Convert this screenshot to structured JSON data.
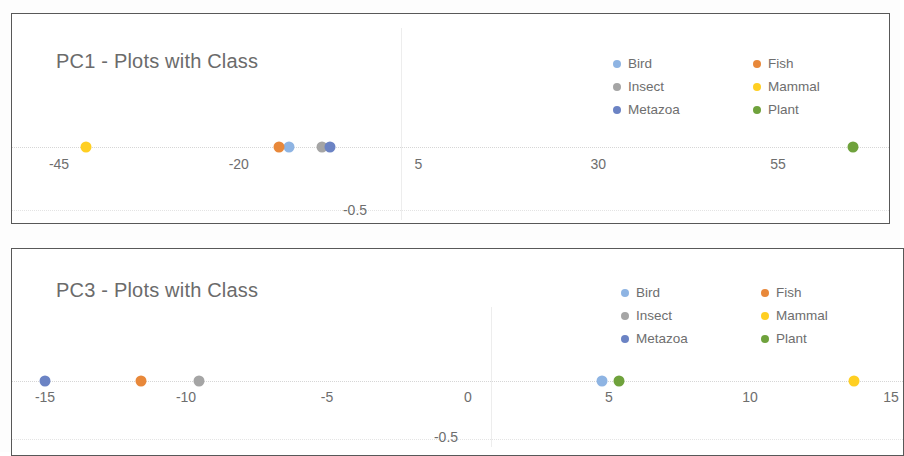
{
  "colors": {
    "Bird": "#8eb4e3",
    "Fish": "#e8883a",
    "Insect": "#a5a5a5",
    "Mammal": "#ffcf22",
    "Metazoa": "#6b83c4",
    "Plant": "#6fa23c",
    "title_text": "#6b6b6b",
    "frame": "#585858",
    "gridline": "#ededed"
  },
  "legend": {
    "entries": [
      {
        "label": "Bird",
        "color_key": "Bird"
      },
      {
        "label": "Fish",
        "color_key": "Fish"
      },
      {
        "label": "Insect",
        "color_key": "Insect"
      },
      {
        "label": "Mammal",
        "color_key": "Mammal"
      },
      {
        "label": "Metazoa",
        "color_key": "Metazoa"
      },
      {
        "label": "Plant",
        "color_key": "Plant"
      }
    ]
  },
  "chart_data": [
    {
      "id": "pc1",
      "type": "scatter",
      "title": "PC1 - Plots with Class",
      "xlabel": "",
      "ylabel": "",
      "xlim": [
        -52,
        72
      ],
      "ylim": [
        -0.5,
        0.5
      ],
      "grid": true,
      "legend_position": "top-right",
      "xticks": [
        -45,
        -20,
        5,
        30,
        55
      ],
      "xtick_labels": [
        "-45",
        "-20",
        "5",
        "30",
        "55"
      ],
      "yticks": [
        -0.5
      ],
      "ytick_labels": [
        "-0.5"
      ],
      "series": [
        {
          "name": "Bird",
          "x": [
            -13.0
          ],
          "y": [
            0
          ]
        },
        {
          "name": "Fish",
          "x": [
            -14.4
          ],
          "y": [
            0
          ]
        },
        {
          "name": "Insect",
          "x": [
            -8.4
          ],
          "y": [
            0
          ]
        },
        {
          "name": "Mammal",
          "x": [
            -41.2
          ],
          "y": [
            0
          ]
        },
        {
          "name": "Metazoa",
          "x": [
            -7.3
          ],
          "y": [
            0
          ]
        },
        {
          "name": "Plant",
          "x": [
            65.4
          ],
          "y": [
            0
          ]
        }
      ]
    },
    {
      "id": "pc3",
      "type": "scatter",
      "title": "PC3 - Plots with Class",
      "xlabel": "",
      "ylabel": "",
      "xlim": [
        -16.5,
        15.6
      ],
      "ylim": [
        -0.5,
        0.5
      ],
      "grid": true,
      "legend_position": "top-right",
      "xticks": [
        -15,
        -10,
        -5,
        0,
        5,
        10,
        15
      ],
      "xtick_labels": [
        "-15",
        "-10",
        "-5",
        "0",
        "5",
        "10",
        "15"
      ],
      "yticks": [
        -0.5
      ],
      "ytick_labels": [
        "-0.5"
      ],
      "series": [
        {
          "name": "Bird",
          "x": [
            4.75
          ],
          "y": [
            0
          ]
        },
        {
          "name": "Fish",
          "x": [
            -11.6
          ],
          "y": [
            0
          ]
        },
        {
          "name": "Insect",
          "x": [
            -9.55
          ],
          "y": [
            0
          ]
        },
        {
          "name": "Mammal",
          "x": [
            13.7
          ],
          "y": [
            0
          ]
        },
        {
          "name": "Metazoa",
          "x": [
            -15.0
          ],
          "y": [
            0
          ]
        },
        {
          "name": "Plant",
          "x": [
            5.35
          ],
          "y": [
            0
          ]
        }
      ]
    }
  ]
}
